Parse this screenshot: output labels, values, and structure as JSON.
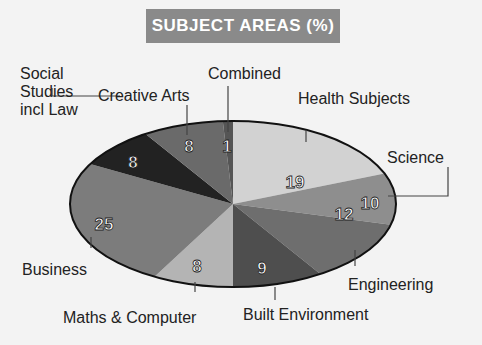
{
  "chart_data": {
    "type": "pie",
    "title": "SUBJECT AREAS (%)",
    "categories": [
      "Health Subjects",
      "Science",
      "Engineering",
      "Built Environment",
      "Maths & Computer",
      "Business",
      "Social Studies incl Law",
      "Creative Arts",
      "Combined"
    ],
    "values": [
      19,
      10,
      12,
      9,
      8,
      25,
      8,
      8,
      1
    ],
    "colors": [
      "#d2d2d2",
      "#8e8e8e",
      "#6e6e6e",
      "#4e4e4e",
      "#b4b4b4",
      "#7c7c7c",
      "#222222",
      "#6a6a6a",
      "#555555"
    ],
    "start_angle": "top, clockwise"
  },
  "labels": {
    "title": "SUBJECT AREAS (%)",
    "social": "Social\nStudies\nincl Law",
    "social_l1": "Social",
    "social_l2": "Studies",
    "social_l3": "incl Law",
    "creative": "Creative Arts",
    "combined": "Combined",
    "health": "Health Subjects",
    "science": "Science",
    "engineering": "Engineering",
    "built": "Built Environment",
    "maths": "Maths & Computer",
    "business": "Business"
  },
  "values_text": {
    "health": "19",
    "science": "10",
    "engineering": "12",
    "built": "9",
    "maths": "8",
    "business": "25",
    "social": "8",
    "creative": "8",
    "combined": "1"
  }
}
